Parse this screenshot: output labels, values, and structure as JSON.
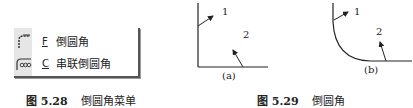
{
  "menu": {
    "items": [
      {
        "icon": "fillet-icon",
        "accelerator": "F",
        "label": "倒圆角"
      },
      {
        "icon": "chain-fillet-icon",
        "accelerator": "C",
        "label": "串联倒圆角"
      }
    ]
  },
  "captions": {
    "menu": {
      "number": "图 5.28",
      "title": "倒圆角菜单"
    },
    "figure": {
      "number": "图 5.29",
      "title": "倒圆角"
    }
  },
  "figure": {
    "panels": [
      {
        "id": "a",
        "label": "(a)",
        "callouts": [
          "1",
          "2"
        ],
        "corner": "sharp"
      },
      {
        "id": "b",
        "label": "(b)",
        "callouts": [
          "1",
          "2"
        ],
        "corner": "filleted"
      }
    ]
  }
}
